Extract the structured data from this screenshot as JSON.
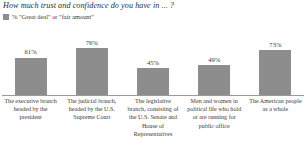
{
  "chart_data": {
    "type": "bar",
    "title": "How much trust and confidence do you have in ... ?",
    "legend": [
      {
        "label": "% \"Great deal\" or \"fair amount\"",
        "color": "#8d8d8d"
      }
    ],
    "legend_position": "top-left",
    "grid": false,
    "xlabel": "",
    "ylabel": "",
    "ylim": [
      0,
      100
    ],
    "categories": [
      "The executive branch headed by the president",
      "The judicial branch, headed by the U.S. Supreme Court",
      "The legislative branch, consisting of the U.S. Senate and House of Representatives",
      "Men and women in political life who hold or are running for public office",
      "The American people as a whole"
    ],
    "values": [
      61,
      76,
      45,
      49,
      73
    ],
    "value_labels": [
      "61%",
      "76%",
      "45%",
      "49%",
      "73%"
    ],
    "bar_color": "#8d8d8d",
    "axis_color": "#9a9a9a"
  }
}
